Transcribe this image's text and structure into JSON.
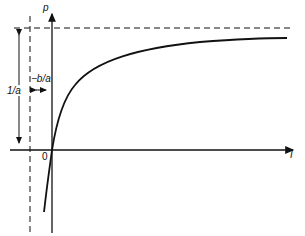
{
  "diagram": {
    "type": "hyperbolic curve plot",
    "y_axis_label": "p",
    "x_axis_label": "I",
    "origin_label": "0",
    "asymptote_height_label": "1/a",
    "offset_label": "−b/a",
    "curve": "p = I / (b + a I)",
    "horizontal_asymptote": "p = 1/a",
    "vertical_asymptote": "I = −b/a",
    "colors": {
      "line": "#111111",
      "background": "#ffffff"
    }
  }
}
